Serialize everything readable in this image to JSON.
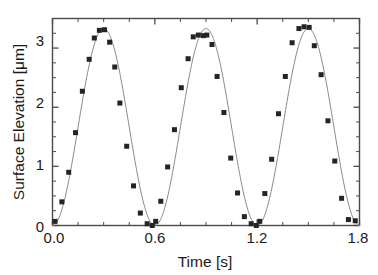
{
  "chart_data": {
    "type": "scatter",
    "title": "",
    "xlabel": "Time [s]",
    "ylabel": "Surface Elevation [μm]",
    "xlim": [
      0.0,
      1.8
    ],
    "ylim": [
      0.0,
      3.5
    ],
    "xticks": [
      0.0,
      0.6,
      1.2,
      1.8
    ],
    "xticklabels": [
      "0.0",
      "0.6",
      "1.2",
      "1.8"
    ],
    "yticks": [
      0,
      1,
      2,
      3
    ],
    "yticklabels": [
      "0",
      "1",
      "2",
      "3"
    ],
    "x_minor_tick_interval": 0.15,
    "y_minor_tick_interval": 0.25,
    "grid": false,
    "legend": null,
    "marker": "square",
    "marker_color": "#242424",
    "marker_size_px": 5,
    "line_color": "#8a8a8a",
    "line_width_px": 1,
    "frame_color": "#4a4a4a",
    "background": "#ffffff",
    "series": [
      {
        "name": "Surface Elevation",
        "x": [
          0.015,
          0.055,
          0.095,
          0.135,
          0.175,
          0.215,
          0.245,
          0.275,
          0.305,
          0.335,
          0.365,
          0.395,
          0.435,
          0.475,
          0.515,
          0.555,
          0.585,
          0.605,
          0.635,
          0.675,
          0.715,
          0.755,
          0.795,
          0.825,
          0.855,
          0.885,
          0.905,
          0.935,
          0.965,
          1.005,
          1.045,
          1.085,
          1.125,
          1.165,
          1.195,
          1.215,
          1.245,
          1.285,
          1.325,
          1.365,
          1.405,
          1.445,
          1.475,
          1.505,
          1.535,
          1.575,
          1.615,
          1.655,
          1.695,
          1.735,
          1.775
        ],
        "y": [
          0.07,
          0.4,
          0.9,
          1.57,
          2.27,
          2.81,
          3.17,
          3.3,
          3.31,
          3.1,
          2.68,
          2.07,
          1.34,
          0.67,
          0.21,
          0.03,
          0.0,
          0.07,
          0.41,
          0.99,
          1.62,
          2.33,
          2.82,
          3.19,
          3.22,
          3.21,
          3.22,
          3.06,
          2.52,
          1.91,
          1.14,
          0.55,
          0.15,
          0.03,
          0.0,
          0.07,
          0.54,
          1.12,
          1.89,
          2.52,
          3.09,
          3.33,
          3.36,
          3.35,
          3.04,
          2.55,
          1.77,
          1.09,
          0.46,
          0.1,
          0.08
        ]
      }
    ]
  },
  "axes": {
    "y_tick_0": "0",
    "y_tick_1": "1",
    "y_tick_2": "2",
    "y_tick_3": "3",
    "x_tick_0": "0.0",
    "x_tick_1": "0.6",
    "x_tick_2": "1.2",
    "x_tick_3": "1.8"
  }
}
